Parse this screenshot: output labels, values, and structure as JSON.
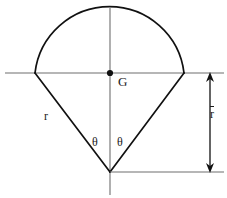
{
  "figure": {
    "kind": "geometry-diagram",
    "background_color": "#ffffff",
    "outline_color": "#111111",
    "axis_color": "#6e6e6e",
    "dimension_color": "#111111",
    "label_color": "#1a1a1a",
    "outline_width": 1.6,
    "axis_width": 1.1,
    "labels": {
      "centroid": "G",
      "radius": "r",
      "angle_left": "θ",
      "angle_right": "θ",
      "centroidal_distance": "r"
    },
    "geometry": {
      "center_x": 110,
      "center_y": 73,
      "apex_x": 110,
      "apex_y": 172,
      "radius": 75,
      "arc_top_y": 12,
      "arc_left_x": 35,
      "arc_right_x": 184,
      "horizontal_axis_y": 73,
      "horizontal_axis_x_start": 5,
      "horizontal_axis_x_end": 224,
      "vertical_axis_x": 110,
      "vertical_axis_y_start": 8,
      "vertical_axis_y_end": 195,
      "dimension_x": 210,
      "dimension_y_top": 73,
      "dimension_y_bottom": 172,
      "extension_line_y": 172,
      "extension_line_x_start": 110,
      "extension_line_x_end": 224,
      "centroid_dot_radius": 3.1
    }
  }
}
